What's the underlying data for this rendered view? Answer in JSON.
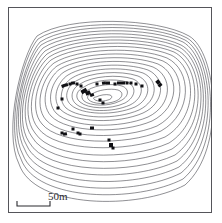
{
  "figure": {
    "kind": "contour-map",
    "background_color": "#ffffff",
    "border_color": "#55555a",
    "width": 222,
    "height": 223
  },
  "scale_bar": {
    "label": "50m",
    "length_px": 33,
    "units": "m",
    "value": 50,
    "line_color": "#2b2b2f"
  },
  "chart_data": {
    "type": "contour",
    "title": "",
    "subtitle": "",
    "xlabel": "",
    "ylabel": "",
    "grid": false,
    "legend": "none",
    "contour_count": 21,
    "contour_color": "#33333a",
    "contour_line_width": 0.55,
    "marker_color": "#101014",
    "marker_count": 34,
    "annotations": [
      "50m"
    ],
    "contours": [
      {
        "index": 0,
        "path": "M 96 97 C 100 95 106 94 110 95 C 113 96 112 99 108 100 C 102 102 95 101 94 99 C 93 98 94 97 96 97 Z"
      },
      {
        "index": 1,
        "path": "M 92 94 C 98 90 110 88 118 90 C 124 92 123 98 116 101 C 106 105 93 104 89 100 C 86 97 88 95 92 94 Z"
      },
      {
        "index": 2,
        "path": "M 88 90 C 96 85 112 83 122 86 C 130 89 129 97 120 101 C 108 107 90 106 84 101 C 80 97 82 92 88 90 Z"
      },
      {
        "index": 3,
        "path": "M 84 87 C 94 80 114 78 127 82 C 137 86 136 97 125 103 C 110 110 88 109 80 102 C 74 97 77 90 84 87 Z"
      },
      {
        "index": 4,
        "path": "M 80 84 C 92 76 118 74 133 79 C 145 84 144 98 130 105 C 112 113 85 112 76 104 C 69 98 72 88 80 84 Z"
      },
      {
        "index": 5,
        "path": "M 76 81 C 90 72 120 70 138 76 C 152 82 151 99 135 107 C 114 116 82 115 71 105 C 63 98 67 86 76 81 Z"
      },
      {
        "index": 6,
        "path": "M 72 78 C 88 68 122 66 143 73 C 159 80 158 101 139 110 C 116 120 79 119 66 108 C 57 99 62 84 72 78 Z"
      },
      {
        "index": 7,
        "path": "M 68 75 C 86 64 125 62 148 70 C 166 78 165 103 143 113 C 118 124 75 123 61 110 C 51 100 57 82 68 75 Z"
      },
      {
        "index": 8,
        "path": "M 64 72 C 84 60 128 58 153 67 C 173 76 173 105 148 117 C 120 129 71 128 56 113 C 45 101 52 80 64 72 Z"
      },
      {
        "index": 9,
        "path": "M 60 69 C 82 56 131 54 158 64 C 180 74 180 107 152 121 C 122 134 67 133 51 116 C 39 103 47 78 60 69 Z"
      },
      {
        "index": 10,
        "path": "M 57 66 C 80 52 134 50 163 61 C 186 72 187 110 157 126 C 124 140 63 139 46 120 C 33 105 43 76 57 66 Z"
      },
      {
        "index": 11,
        "path": "M 54 63 C 78 48 137 46 167 58 C 192 70 193 113 161 131 C 126 146 59 145 42 124 C 28 108 39 74 54 63 Z"
      },
      {
        "index": 12,
        "path": "M 51 60 C 76 44 140 42 171 55 C 197 68 199 117 165 137 C 127 153 55 152 38 128 C 23 110 36 72 51 60 Z"
      },
      {
        "index": 13,
        "path": "M 49 57 C 75 40 143 39 174 52 C 201 66 204 121 169 143 C 129 161 52 160 35 133 C 19 113 33 70 49 57 Z"
      },
      {
        "index": 14,
        "path": "M 47 54 C 74 36 146 36 177 50 C 204 64 208 125 172 149 C 131 168 49 167 32 137 C 16 115 31 68 47 54 Z"
      },
      {
        "index": 15,
        "path": "M 45 51 C 73 33 148 33 179 47 C 207 62 211 129 175 155 C 133 175 46 174 29 142 C 13 118 29 66 45 51 Z"
      },
      {
        "index": 16,
        "path": "M 43 48 C 72 29 150 30 181 45 C 209 60 214 133 177 161 C 134 182 43 181 27 146 C 11 120 27 64 43 48 Z"
      },
      {
        "index": 17,
        "path": "M 41 45 C 71 26 152 27 183 42 C 211 58 217 137 179 167 C 135 189 40 188 25 150 C 9 123 25 62 41 45 Z"
      },
      {
        "index": 18,
        "path": "M 40 42 C 70 22 154 24 185 40 C 213 56 220 141 181 173 C 136 196 38 195 23 155 C 7 126 24 60 40 42 Z"
      },
      {
        "index": 19,
        "path": "M 38 39 C 69 19 156 21 187 38 C 215 54 223 145 183 179 C 137 203 36 202 21 159 C 5 129 22 58 38 39 Z"
      },
      {
        "index": 20,
        "path": "M 37 36 C 68 15 158 18 189 36 C 217 52 226 149 185 185 C 138 210 34 209 19 164 C 3 132 21 56 37 36 Z"
      }
    ],
    "markers": [
      {
        "x": 63,
        "y": 86,
        "w": 3,
        "h": 3,
        "r": -20
      },
      {
        "x": 66,
        "y": 85,
        "w": 4,
        "h": 3,
        "r": -15
      },
      {
        "x": 70,
        "y": 84,
        "w": 3,
        "h": 3,
        "r": 0
      },
      {
        "x": 73,
        "y": 83,
        "w": 4,
        "h": 3,
        "r": -10
      },
      {
        "x": 77,
        "y": 84,
        "w": 3,
        "h": 3,
        "r": 0
      },
      {
        "x": 81,
        "y": 86,
        "w": 3,
        "h": 3,
        "r": 0
      },
      {
        "x": 84,
        "y": 91,
        "w": 6,
        "h": 4,
        "r": -28
      },
      {
        "x": 88,
        "y": 93,
        "w": 5,
        "h": 4,
        "r": -25
      },
      {
        "x": 92,
        "y": 95,
        "w": 4,
        "h": 3,
        "r": -20
      },
      {
        "x": 97,
        "y": 84,
        "w": 3,
        "h": 3,
        "r": 0
      },
      {
        "x": 104,
        "y": 83,
        "w": 4,
        "h": 3,
        "r": -10
      },
      {
        "x": 108,
        "y": 83,
        "w": 4,
        "h": 3,
        "r": 0
      },
      {
        "x": 115,
        "y": 84,
        "w": 3,
        "h": 3,
        "r": 0
      },
      {
        "x": 119,
        "y": 83,
        "w": 4,
        "h": 3,
        "r": 0
      },
      {
        "x": 123,
        "y": 83,
        "w": 4,
        "h": 3,
        "r": 0
      },
      {
        "x": 127,
        "y": 83,
        "w": 3,
        "h": 3,
        "r": 0
      },
      {
        "x": 131,
        "y": 83,
        "w": 3,
        "h": 3,
        "r": 0
      },
      {
        "x": 136,
        "y": 84,
        "w": 3,
        "h": 3,
        "r": 0
      },
      {
        "x": 158,
        "y": 82,
        "w": 4,
        "h": 4,
        "r": -40
      },
      {
        "x": 160,
        "y": 85,
        "w": 4,
        "h": 3,
        "r": -35
      },
      {
        "x": 62,
        "y": 99,
        "w": 3,
        "h": 3,
        "r": 0
      },
      {
        "x": 100,
        "y": 100,
        "w": 3,
        "h": 3,
        "r": 0
      },
      {
        "x": 103,
        "y": 103,
        "w": 3,
        "h": 3,
        "r": 0
      },
      {
        "x": 62,
        "y": 133,
        "w": 3,
        "h": 3,
        "r": 0
      },
      {
        "x": 65,
        "y": 134,
        "w": 4,
        "h": 3,
        "r": -10
      },
      {
        "x": 73,
        "y": 129,
        "w": 3,
        "h": 3,
        "r": 0
      },
      {
        "x": 78,
        "y": 133,
        "w": 3,
        "h": 3,
        "r": 0
      },
      {
        "x": 80,
        "y": 134,
        "w": 3,
        "h": 3,
        "r": 0
      },
      {
        "x": 92,
        "y": 128,
        "w": 4,
        "h": 3,
        "r": 0
      },
      {
        "x": 109,
        "y": 140,
        "w": 3,
        "h": 3,
        "r": 0
      },
      {
        "x": 111,
        "y": 145,
        "w": 4,
        "h": 4,
        "r": 0
      },
      {
        "x": 113,
        "y": 148,
        "w": 3,
        "h": 3,
        "r": 0
      },
      {
        "x": 58,
        "y": 108,
        "w": 3,
        "h": 3,
        "r": 0
      },
      {
        "x": 142,
        "y": 86,
        "w": 3,
        "h": 3,
        "r": 0
      }
    ]
  }
}
